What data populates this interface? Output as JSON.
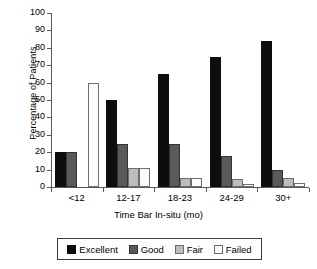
{
  "chart_data": {
    "type": "bar",
    "title": "",
    "xlabel": "Time Bar In-situ (mo)",
    "ylabel": "Percentage of Patients",
    "ylim": [
      0,
      100
    ],
    "yticks": [
      0,
      10,
      20,
      30,
      40,
      50,
      60,
      70,
      80,
      90,
      100
    ],
    "ytick_labels": [
      "0",
      "10",
      "20",
      "30",
      "40",
      "50",
      "60",
      "70",
      "80",
      "90",
      "100"
    ],
    "grid": false,
    "legend_position": "bottom",
    "categories": [
      "<12",
      "12-17",
      "18-23",
      "24-29",
      "30+"
    ],
    "series": [
      {
        "name": "Excellent",
        "color": "#0d0d0d",
        "values": [
          20,
          50,
          65,
          74.5,
          84
        ]
      },
      {
        "name": "Good",
        "color": "#595959",
        "values": [
          20,
          24.5,
          24.5,
          18,
          9.5
        ]
      },
      {
        "name": "Fair",
        "color": "#bdbdbd",
        "values": [
          0,
          11,
          5,
          4.5,
          5
        ]
      },
      {
        "name": "Failed",
        "color": "#fbfbfb",
        "values": [
          60,
          11,
          5,
          2,
          2.5
        ]
      }
    ]
  },
  "legend": {
    "items": [
      {
        "label": "Excellent",
        "swatch": "excellent"
      },
      {
        "label": "Good",
        "swatch": "good"
      },
      {
        "label": "Fair",
        "swatch": "fair"
      },
      {
        "label": "Failed",
        "swatch": "failed"
      }
    ]
  }
}
